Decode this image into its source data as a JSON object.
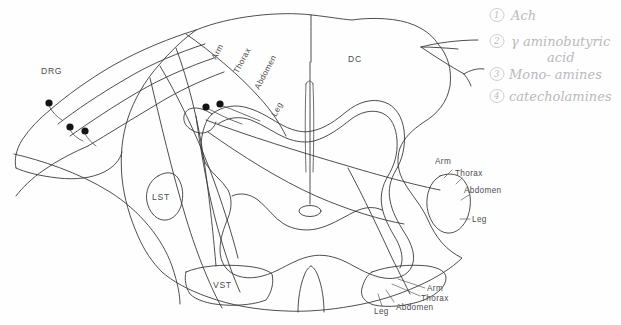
{
  "figure": {
    "ink_color": "#3a3a3c",
    "legend_ink_color": "#b9b9bd"
  },
  "tracts": {
    "dorsal_column": "DC",
    "lateral_spinothalamic": "LST",
    "ventral_spinothalamic": "VST",
    "dorsal_root_ganglion": "DRG"
  },
  "somatotopy": {
    "dorsal_column_rotated": [
      "Arm",
      "Thorax",
      "Abdomen",
      "Leg"
    ],
    "lateral_nucleus": [
      "Arm",
      "Thorax",
      "Abdomen",
      "Leg"
    ],
    "ventral_nucleus": [
      "Arm",
      "Thorax",
      "Abdomen",
      "Leg"
    ]
  },
  "legend": {
    "items": [
      {
        "number": "1",
        "label": "Ach"
      },
      {
        "number": "2",
        "label": "γ aminobutyric"
      },
      {
        "number": "2b",
        "label": "acid"
      },
      {
        "number": "3",
        "label": "Mono- amines"
      },
      {
        "number": "4",
        "label": "catecholamines"
      }
    ]
  }
}
